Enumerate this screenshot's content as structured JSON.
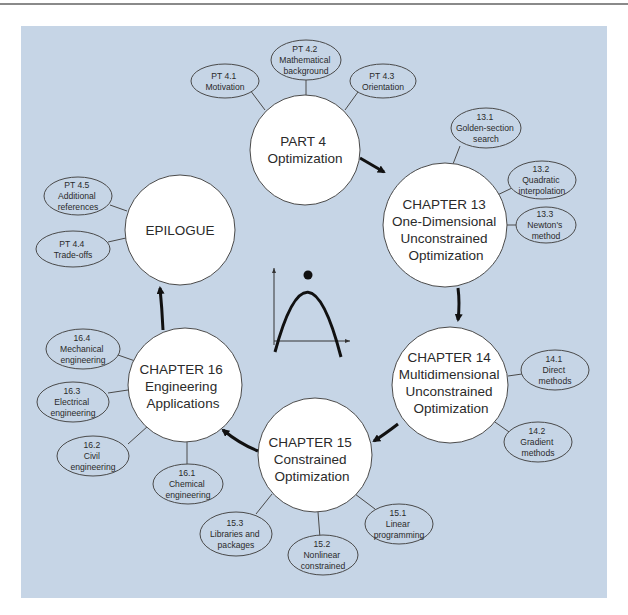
{
  "header": {
    "running_head": "PT 4.3 ORIENTATION"
  },
  "diagram": {
    "colors": {
      "background_panel": "#c6d5e6",
      "node_fill": "#ffffff",
      "node_stroke": "#4a4a4a",
      "arrow": "#111111",
      "text": "#2a2a2a"
    },
    "main_nodes": [
      {
        "id": "part4",
        "lines": [
          "PART 4",
          "Optimization"
        ]
      },
      {
        "id": "ch13",
        "lines": [
          "CHAPTER 13",
          "One-Dimensional",
          "Unconstrained",
          "Optimization"
        ]
      },
      {
        "id": "ch14",
        "lines": [
          "CHAPTER 14",
          "Multidimensional",
          "Unconstrained",
          "Optimization"
        ]
      },
      {
        "id": "ch15",
        "lines": [
          "CHAPTER 15",
          "Constrained",
          "Optimization"
        ]
      },
      {
        "id": "ch16",
        "lines": [
          "CHAPTER 16",
          "Engineering",
          "Applications"
        ]
      },
      {
        "id": "epilogue",
        "lines": [
          "EPILOGUE"
        ]
      }
    ],
    "sub_nodes": [
      {
        "parent": "part4",
        "lines": [
          "PT 4.1",
          "Motivation"
        ]
      },
      {
        "parent": "part4",
        "lines": [
          "PT 4.2",
          "Mathematical",
          "background"
        ]
      },
      {
        "parent": "part4",
        "lines": [
          "PT 4.3",
          "Orientation"
        ]
      },
      {
        "parent": "ch13",
        "lines": [
          "13.1",
          "Golden-section",
          "search"
        ]
      },
      {
        "parent": "ch13",
        "lines": [
          "13.2",
          "Quadratic",
          "interpolation"
        ]
      },
      {
        "parent": "ch13",
        "lines": [
          "13.3",
          "Newton's",
          "method"
        ]
      },
      {
        "parent": "ch14",
        "lines": [
          "14.1",
          "Direct",
          "methods"
        ]
      },
      {
        "parent": "ch14",
        "lines": [
          "14.2",
          "Gradient",
          "methods"
        ]
      },
      {
        "parent": "ch15",
        "lines": [
          "15.1",
          "Linear",
          "programming"
        ]
      },
      {
        "parent": "ch15",
        "lines": [
          "15.2",
          "Nonlinear",
          "constrained"
        ]
      },
      {
        "parent": "ch15",
        "lines": [
          "15.3",
          "Libraries and",
          "packages"
        ]
      },
      {
        "parent": "ch16",
        "lines": [
          "16.1",
          "Chemical",
          "engineering"
        ]
      },
      {
        "parent": "ch16",
        "lines": [
          "16.2",
          "Civil",
          "engineering"
        ]
      },
      {
        "parent": "ch16",
        "lines": [
          "16.3",
          "Electrical",
          "engineering"
        ]
      },
      {
        "parent": "ch16",
        "lines": [
          "16.4",
          "Mechanical",
          "engineering"
        ]
      },
      {
        "parent": "epilogue",
        "lines": [
          "PT 4.4",
          "Trade-offs"
        ]
      },
      {
        "parent": "epilogue",
        "lines": [
          "PT 4.5",
          "Additional",
          "references"
        ]
      }
    ],
    "flow": [
      "part4",
      "ch13",
      "ch14",
      "ch15",
      "ch16",
      "epilogue"
    ],
    "center_icon": "parabola-maximum-graph-icon"
  }
}
